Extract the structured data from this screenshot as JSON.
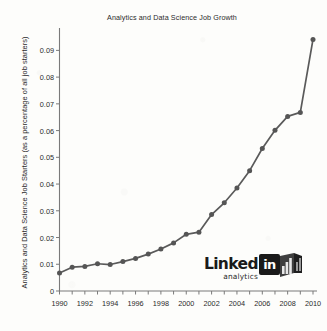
{
  "chart_data": {
    "type": "line",
    "title": "Analytics and Data Science Job Growth",
    "xlabel": "",
    "ylabel": "Analytics and Data Science Job Starters (as a percentage of all job starters)",
    "x": [
      1990,
      1991,
      1992,
      1993,
      1994,
      1995,
      1996,
      1997,
      1998,
      1999,
      2000,
      2001,
      2002,
      2003,
      2004,
      2005,
      2006,
      2007,
      2008,
      2009,
      2010
    ],
    "values": [
      0.0067,
      0.0089,
      0.0092,
      0.0102,
      0.0099,
      0.011,
      0.0122,
      0.0138,
      0.0157,
      0.018,
      0.0212,
      0.022,
      0.0286,
      0.033,
      0.0385,
      0.045,
      0.0533,
      0.0601,
      0.0653,
      0.0668,
      0.0941
    ],
    "xlim": [
      1990,
      2010
    ],
    "ylim": [
      0,
      0.0965
    ],
    "x_tick_labels": [
      "1990",
      "1992",
      "1994",
      "1996",
      "1998",
      "2000",
      "2002",
      "2004",
      "2006",
      "2008",
      "2010"
    ],
    "x_tick_values": [
      1990,
      1992,
      1994,
      1996,
      1998,
      2000,
      2002,
      2004,
      2006,
      2008,
      2010
    ],
    "x_minor_ticks": [
      1991,
      1993,
      1995,
      1997,
      1999,
      2001,
      2003,
      2005,
      2007,
      2009
    ],
    "y_tick_labels": [
      "0",
      "0.01",
      "0.02",
      "0.03",
      "0.04",
      "0.05",
      "0.06",
      "0.07",
      "0.08",
      "0.09"
    ],
    "y_tick_values": [
      0,
      0.01,
      0.02,
      0.03,
      0.04,
      0.05,
      0.06,
      0.07,
      0.08,
      0.09
    ],
    "grid": false,
    "legend": null,
    "line_color": "#5a5a5a",
    "marker_color": "#555555",
    "axis_color": "#7a7a7a",
    "background_color": "#fdfdfb",
    "text_color": "#2b2b2b"
  },
  "watermark": {
    "brand": "Linked",
    "sub": "analytics",
    "badge": "in"
  }
}
